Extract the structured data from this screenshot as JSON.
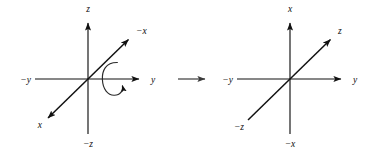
{
  "figure": {
    "caption": "",
    "background_color": "#ffffff",
    "stroke_color": "#111111",
    "transition_arrow_color": "#4a4a4a"
  },
  "left_diagram": {
    "name": "left-coordinate-axes",
    "origin": {
      "x": 88,
      "y": 79
    },
    "rotation_indicator": {
      "name": "rotation-arrow",
      "about_axis": "y",
      "direction": "counterclockwise"
    },
    "axes": [
      {
        "id": "z-positive",
        "label": "z",
        "direction": "up",
        "tip": {
          "x": 88,
          "y": 20
        },
        "label_pos": {
          "x": 88,
          "y": 12
        },
        "arrow": true,
        "kind": "vertical"
      },
      {
        "id": "z-negative",
        "label": "−z",
        "direction": "down",
        "tip": {
          "x": 88,
          "y": 134
        },
        "label_pos": {
          "x": 88,
          "y": 146
        },
        "arrow": false,
        "kind": "vertical"
      },
      {
        "id": "y-positive",
        "label": "y",
        "direction": "right",
        "tip": {
          "x": 142,
          "y": 79
        },
        "label_pos": {
          "x": 152,
          "y": 82
        },
        "arrow": true,
        "kind": "horizontal"
      },
      {
        "id": "y-negative",
        "label": "−y",
        "direction": "left",
        "tip": {
          "x": 35,
          "y": 79
        },
        "label_pos": {
          "x": 24,
          "y": 82
        },
        "arrow": false,
        "kind": "horizontal"
      },
      {
        "id": "x-negative",
        "label": "−x",
        "direction": "upper-right",
        "tip": {
          "x": 131,
          "y": 37
        },
        "label_pos": {
          "x": 140,
          "y": 33
        },
        "arrow": true,
        "kind": "diagonal"
      },
      {
        "id": "x-positive",
        "label": "x",
        "direction": "lower-left",
        "tip": {
          "x": 45,
          "y": 121
        },
        "label_pos": {
          "x": 38,
          "y": 126
        },
        "arrow": true,
        "kind": "diagonal"
      }
    ]
  },
  "transition": {
    "name": "transition-arrow",
    "symbol": "→",
    "from": {
      "x": 178,
      "y": 79
    },
    "to": {
      "x": 208,
      "y": 79
    }
  },
  "right_diagram": {
    "name": "right-coordinate-axes",
    "origin": {
      "x": 290,
      "y": 79
    },
    "axes": [
      {
        "id": "x-positive",
        "label": "x",
        "direction": "up",
        "tip": {
          "x": 290,
          "y": 20
        },
        "label_pos": {
          "x": 290,
          "y": 12
        },
        "arrow": true,
        "kind": "vertical"
      },
      {
        "id": "x-negative",
        "label": "−x",
        "direction": "down",
        "tip": {
          "x": 290,
          "y": 134
        },
        "label_pos": {
          "x": 290,
          "y": 146
        },
        "arrow": false,
        "kind": "vertical"
      },
      {
        "id": "y-positive",
        "label": "y",
        "direction": "right",
        "tip": {
          "x": 344,
          "y": 79
        },
        "label_pos": {
          "x": 354,
          "y": 82
        },
        "arrow": true,
        "kind": "horizontal"
      },
      {
        "id": "y-negative",
        "label": "−y",
        "direction": "left",
        "tip": {
          "x": 237,
          "y": 79
        },
        "label_pos": {
          "x": 226,
          "y": 82
        },
        "arrow": false,
        "kind": "horizontal"
      },
      {
        "id": "z-positive",
        "label": "z",
        "direction": "upper-right",
        "tip": {
          "x": 333,
          "y": 37
        },
        "label_pos": {
          "x": 342,
          "y": 33
        },
        "arrow": true,
        "kind": "diagonal"
      },
      {
        "id": "z-negative",
        "label": "−z",
        "direction": "lower-left",
        "tip": {
          "x": 247,
          "y": 121
        },
        "label_pos": {
          "x": 240,
          "y": 128
        },
        "arrow": false,
        "kind": "diagonal"
      }
    ]
  }
}
